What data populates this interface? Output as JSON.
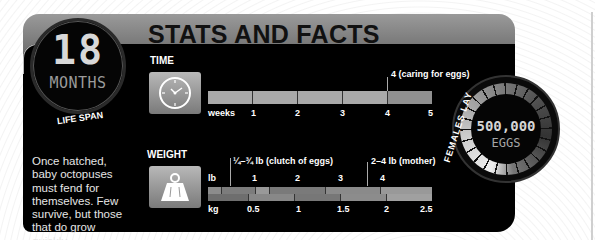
{
  "header": {
    "title": "STATS AND FACTS"
  },
  "life_span": {
    "value": "18",
    "unit": "MONTHS",
    "label": "LIFE SPAN"
  },
  "blurb": "Once hatched, baby octopuses must fend for themselves. Few survive, but those that do grow quickly.",
  "time": {
    "label": "TIME",
    "icon": "clock-icon",
    "axis_label": "weeks",
    "ticks": [
      "1",
      "2",
      "3",
      "4",
      "5"
    ],
    "marker": {
      "value": 4,
      "label": "4 (caring for eggs)"
    }
  },
  "weight": {
    "label": "WEIGHT",
    "icon": "weight-icon",
    "lb_label": "lb",
    "kg_label": "kg",
    "lb_ticks": [
      "1",
      "2",
      "3",
      "4"
    ],
    "kg_ticks": [
      "0.5",
      "1",
      "1.5",
      "2",
      "2.5"
    ],
    "markers": [
      {
        "label": "¼–¾ lb (clutch of eggs)"
      },
      {
        "label": "2–4 lb (mother)"
      }
    ]
  },
  "eggs": {
    "value": "500,000",
    "unit": "EGGS",
    "label": "FEMALES LAY"
  },
  "colors": {
    "panel": "#000000",
    "header": "#808080",
    "bar": "#a9a9a9",
    "text": "#ffffff"
  }
}
